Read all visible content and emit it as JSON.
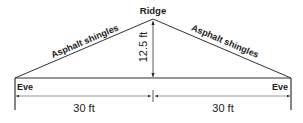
{
  "diagram": {
    "type": "roof cross-section",
    "ridge_label": "Ridge",
    "left_slope_label": "Asphalt shingles",
    "right_slope_label": "Asphalt shingles",
    "left_eave_label": "Eve",
    "right_eave_label": "Eve",
    "height_label": "12.5 ft",
    "left_span_label": "30 ft",
    "right_span_label": "30 ft",
    "line_color": "#333333"
  }
}
